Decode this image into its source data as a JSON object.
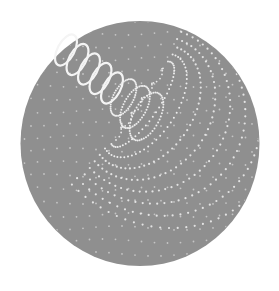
{
  "canvas": {
    "width": 279,
    "height": 291,
    "background": "#ffffff"
  },
  "disc": {
    "cx": 140,
    "cy": 143.5,
    "rx": 119.5,
    "ry": 122.5,
    "fill": "#8f8f8f"
  },
  "dot_color": "#f2f2f2",
  "coil": {
    "solid_loops": 5,
    "dotted_loops": 3,
    "start": [
      66,
      50
    ],
    "step": [
      11.5,
      9.5
    ],
    "loop_rx": 8.5,
    "loop_ry": 17,
    "tilt_deg": 28,
    "stroke": "#f4f4f4",
    "stroke_width": 2.2
  },
  "funnel": {
    "apex": [
      116,
      138
    ],
    "top": [
      165,
      68
    ],
    "ring_count": 8,
    "ring_spacing": 15
  },
  "field": {
    "spacing": 13,
    "dot_radius": 0.9
  }
}
